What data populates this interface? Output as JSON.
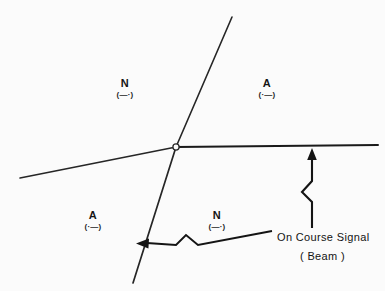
{
  "figure": {
    "background_color": "#fbfbfb",
    "ink_color": "#1a1a1a"
  },
  "quadrants": [
    {
      "id": "upper-left",
      "letter": "N",
      "morse": "(—·)",
      "morse_plain": "dash dot",
      "x": 125,
      "y": 78
    },
    {
      "id": "upper-right",
      "letter": "A",
      "morse": "(·—)",
      "morse_plain": "dot dash",
      "x": 267,
      "y": 78
    },
    {
      "id": "lower-left",
      "letter": "A",
      "morse": "(·—)",
      "morse_plain": "dot dash",
      "x": 93,
      "y": 210
    },
    {
      "id": "lower-right",
      "letter": "N",
      "morse": "(—·)",
      "morse_plain": "dash dot",
      "x": 217,
      "y": 210
    }
  ],
  "callout": {
    "main_label": "On Course Signal",
    "sub_label": "( Beam )"
  },
  "beams": {
    "station_marker": "open-circle",
    "course_lines": [
      {
        "id": "steep-course-line",
        "from": [
          232,
          17
        ],
        "to": [
          133,
          283
        ]
      },
      {
        "id": "shallow-course-line",
        "from": [
          20,
          178
        ],
        "to": [
          378,
          146
        ]
      }
    ]
  },
  "leaders": [
    {
      "id": "right-beam-leader",
      "direction": "up",
      "arrow_tip": [
        312,
        150
      ],
      "tail": [
        312,
        228
      ]
    },
    {
      "id": "lower-beam-leader",
      "direction": "left",
      "arrow_tip": [
        137,
        243
      ],
      "tail": [
        272,
        231
      ]
    }
  ]
}
